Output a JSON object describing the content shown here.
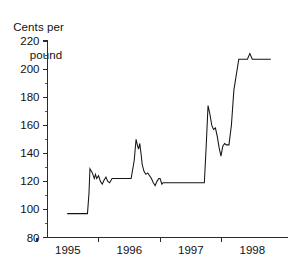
{
  "chart_data": {
    "type": "line",
    "title": "",
    "ylabel": "Cents per pound",
    "ylabel_lines": [
      "Cents per",
      "pound"
    ],
    "xlabel": "",
    "ylim": [
      80,
      220
    ],
    "xlim": [
      1994.67,
      1998.58
    ],
    "yticks": [
      80,
      100,
      120,
      140,
      160,
      180,
      200,
      220
    ],
    "ytick_labels": [
      "80",
      "100",
      "120",
      "140",
      "160",
      "180",
      "200",
      "220"
    ],
    "yminor_step": 10,
    "xticks": [
      1995.0,
      1996.0,
      1997.0,
      1998.0
    ],
    "xtick_labels": [
      "1995",
      "1996",
      "1997",
      "1998"
    ],
    "grid": false,
    "legend": false,
    "legend_position": "none",
    "line_color": "#141414",
    "series": [
      {
        "name": "Price",
        "x": [
          1994.99,
          1995.25,
          1995.32,
          1995.345,
          1995.36,
          1995.4,
          1995.43,
          1995.45,
          1995.47,
          1995.5,
          1995.53,
          1995.56,
          1995.59,
          1995.62,
          1995.65,
          1995.68,
          1995.72,
          1995.76,
          1995.82,
          1995.95,
          1996.03,
          1996.08,
          1996.11,
          1996.13,
          1996.15,
          1996.17,
          1996.19,
          1996.21,
          1996.24,
          1996.27,
          1996.3,
          1996.33,
          1996.36,
          1996.39,
          1996.42,
          1996.45,
          1996.48,
          1996.5,
          1996.53,
          1996.55,
          1996.58,
          1996.62,
          1996.8,
          1997.05,
          1997.22,
          1997.25,
          1997.28,
          1997.31,
          1997.34,
          1997.37,
          1997.4,
          1997.43,
          1997.46,
          1997.49,
          1997.52,
          1997.55,
          1997.58,
          1997.62,
          1997.66,
          1997.7,
          1997.78,
          1997.86,
          1997.92,
          1997.96,
          1998.0,
          1998.2,
          1998.3
        ],
        "y": [
          97,
          97,
          97,
          112,
          129,
          126,
          122,
          125,
          122,
          124,
          120,
          118,
          121,
          123,
          120,
          119,
          122,
          122,
          122,
          122,
          122,
          135,
          150,
          146,
          143,
          147,
          140,
          132,
          127,
          125,
          126,
          124,
          122,
          119,
          117,
          120,
          122,
          122,
          118,
          119,
          119,
          119,
          119,
          119,
          119,
          145,
          174,
          168,
          160,
          157,
          158,
          152,
          144,
          138,
          145,
          147,
          146,
          146,
          160,
          185,
          207,
          207,
          207,
          211,
          207,
          207,
          207
        ]
      }
    ],
    "annotations": []
  },
  "axis_title": {
    "line1": "Cents per",
    "line2": "pound"
  }
}
